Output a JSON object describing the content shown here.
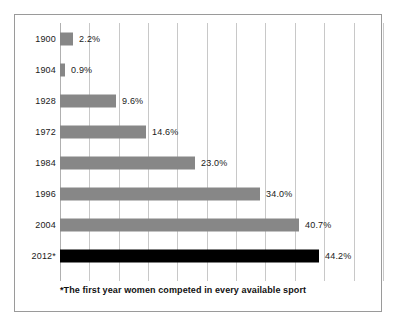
{
  "chart_data": {
    "type": "bar",
    "orientation": "horizontal",
    "title": "",
    "subtitle": "",
    "xlabel": "",
    "ylabel": "",
    "categories": [
      "1900",
      "1904",
      "1928",
      "1972",
      "1984",
      "1996",
      "2004",
      "2012*"
    ],
    "values": [
      2.2,
      0.9,
      9.6,
      14.6,
      23.0,
      34.0,
      40.7,
      44.2
    ],
    "value_labels": [
      "2.2%",
      "0.9%",
      "9.6%",
      "14.6%",
      "23.0%",
      "34.0%",
      "40.7%",
      "44.2%"
    ],
    "bar_colors": [
      "#878787",
      "#878787",
      "#878787",
      "#878787",
      "#878787",
      "#878787",
      "#878787",
      "#000000"
    ],
    "xlim": [
      0,
      55
    ],
    "gridlines": [
      5,
      10,
      15,
      20,
      25,
      30,
      35,
      40,
      45,
      50,
      55
    ],
    "grid": true,
    "legend": false,
    "annotations": [
      "*The first year women competed in every available sport"
    ]
  },
  "footnote": {
    "text": "*The first year women competed in every available sport"
  },
  "colors": {
    "bar_gray": "#878787",
    "bar_black": "#000000",
    "gridline": "#c8c8c8",
    "frame_border": "#9a9a9a",
    "text": "#1a1a1a",
    "background": "#ffffff"
  }
}
